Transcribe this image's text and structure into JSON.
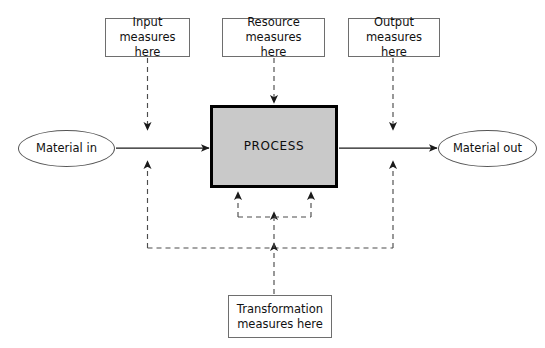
{
  "diagram": {
    "type": "flow-diagram",
    "colors": {
      "process_fill": "#c9c9c9",
      "process_border": "#000000",
      "box_border": "#6e6e6e",
      "ellipse_border": "#555555",
      "solid_flow": "#1a1a1a",
      "dashed_flow": "#4d4d4d",
      "background": "#ffffff"
    },
    "nodes": {
      "input_measures": {
        "label": "Input measures\nhere",
        "shape": "rectangle",
        "x": 105,
        "y": 18,
        "w": 85,
        "h": 39
      },
      "resource_measures": {
        "label": "Resource measures\nhere",
        "shape": "rectangle",
        "x": 222,
        "y": 18,
        "w": 103,
        "h": 39
      },
      "output_measures": {
        "label": "Output measures\nhere",
        "shape": "rectangle",
        "x": 348,
        "y": 18,
        "w": 92,
        "h": 39
      },
      "transformation_measures": {
        "label": "Transformation\nmeasures here",
        "shape": "rectangle",
        "x": 228,
        "y": 295,
        "w": 104,
        "h": 43
      },
      "process": {
        "label": "PROCESS",
        "shape": "rectangle",
        "x": 210,
        "y": 105,
        "w": 128,
        "h": 83
      },
      "material_in": {
        "label": "Material in",
        "shape": "ellipse",
        "x": 18,
        "y": 130,
        "w": 97,
        "h": 37
      },
      "material_out": {
        "label": "Material out",
        "shape": "ellipse",
        "x": 438,
        "y": 130,
        "w": 99,
        "h": 37
      }
    },
    "edges": [
      {
        "name": "material-in-to-process",
        "style": "solid",
        "from": "material_in",
        "to": "process"
      },
      {
        "name": "process-to-material-out",
        "style": "solid",
        "from": "process",
        "to": "material_out"
      },
      {
        "name": "input-measures-to-inflow",
        "style": "dashed",
        "from": "input_measures",
        "to": "inflow_line"
      },
      {
        "name": "resource-measures-to-process",
        "style": "dashed",
        "from": "resource_measures",
        "to": "process"
      },
      {
        "name": "output-measures-to-outflow",
        "style": "dashed",
        "from": "output_measures",
        "to": "outflow_line"
      },
      {
        "name": "transformation-measures-to-process",
        "style": "dashed",
        "from": "transformation_measures",
        "to": "process"
      },
      {
        "name": "feedback-bus-left-riser",
        "style": "dashed",
        "from": "feedback_bus",
        "to": "inflow_line"
      },
      {
        "name": "feedback-bus-right-riser",
        "style": "dashed",
        "from": "feedback_bus",
        "to": "outflow_line"
      },
      {
        "name": "process-underside-bracket-left",
        "style": "dashed",
        "from": "bracket",
        "to": "process"
      },
      {
        "name": "process-underside-bracket-right",
        "style": "dashed",
        "from": "bracket",
        "to": "process"
      }
    ]
  }
}
